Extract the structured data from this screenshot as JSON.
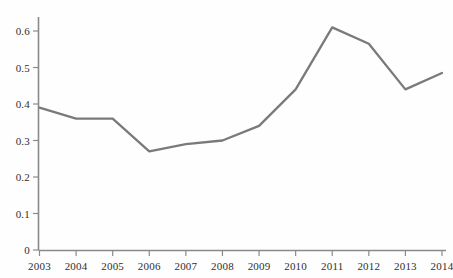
{
  "chart_data": {
    "type": "line",
    "title": "",
    "subtitle": "",
    "xlabel": "",
    "ylabel": "",
    "categories": [
      "2003",
      "2004",
      "2005",
      "2006",
      "2007",
      "2008",
      "2009",
      "2010",
      "2011",
      "2012",
      "2013",
      "2014"
    ],
    "x": [
      2003,
      2004,
      2005,
      2006,
      2007,
      2008,
      2009,
      2010,
      2011,
      2012,
      2013,
      2014
    ],
    "values": [
      0.39,
      0.36,
      0.36,
      0.27,
      0.29,
      0.3,
      0.34,
      0.44,
      0.61,
      0.565,
      0.44,
      0.485
    ],
    "series": [
      {
        "name": "",
        "values": [
          0.39,
          0.36,
          0.36,
          0.27,
          0.29,
          0.3,
          0.34,
          0.44,
          0.61,
          0.565,
          0.44,
          0.485
        ]
      }
    ],
    "xlim": [
      2003,
      2014
    ],
    "ylim": [
      0,
      0.63
    ],
    "y_ticks": [
      0,
      0.1,
      0.2,
      0.3,
      0.4,
      0.5,
      0.6
    ],
    "y_tick_labels": [
      "0",
      "0.1",
      "0.2",
      "0.3",
      "0.4",
      "0.5",
      "0.6"
    ],
    "x_ticks": [
      2003,
      2004,
      2005,
      2006,
      2007,
      2008,
      2009,
      2010,
      2011,
      2012,
      2013,
      2014
    ],
    "x_tick_labels": [
      "2003",
      "2004",
      "2005",
      "2006",
      "2007",
      "2008",
      "2009",
      "2010",
      "2011",
      "2012",
      "2013",
      "2014"
    ],
    "grid": false,
    "legend": false,
    "legend_position": "none",
    "line_color": "#7a7a7a",
    "axis_color": "#8a8a8a",
    "background_color": "#fefefe",
    "annotations": []
  },
  "axes": {
    "y_labels": [
      "0.6",
      "0.5",
      "0.4",
      "0.3",
      "0.2",
      "0.1",
      "0"
    ],
    "x_labels": [
      "2003",
      "2004",
      "2005",
      "2006",
      "2007",
      "2008",
      "2009",
      "2010",
      "2011",
      "2012",
      "2013",
      "2014"
    ]
  }
}
